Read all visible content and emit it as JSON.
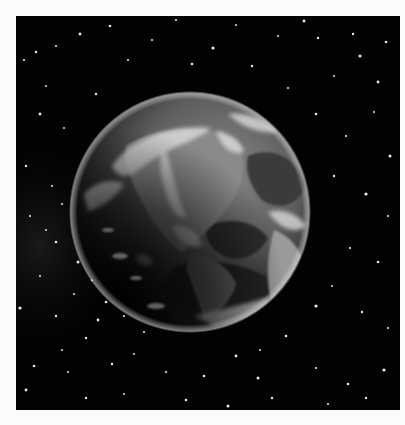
{
  "image": {
    "subject": "Earth from space with starfield",
    "colors": {
      "page_background": "#fbfbfb",
      "space": "#020202",
      "ocean": "#3a3a3a",
      "land": "#8c8c8c",
      "clouds": "#d8d8d8",
      "night_side": "#0c0c0c"
    },
    "frame": {
      "x": 16,
      "y": 16,
      "width": 384,
      "height": 394
    },
    "earth": {
      "cx": 174,
      "cy": 196,
      "r": 119
    }
  }
}
